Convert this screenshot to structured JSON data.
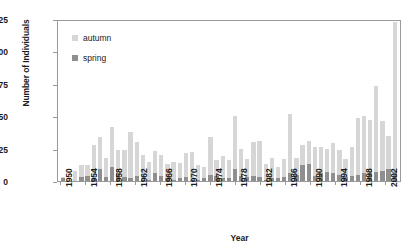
{
  "chart_data": {
    "type": "bar",
    "stacked": true,
    "title": "",
    "xlabel": "Year",
    "ylabel": "Number of Individuals",
    "ylim": [
      0,
      125
    ],
    "yticks": [
      0,
      25,
      50,
      75,
      100,
      125
    ],
    "grid": false,
    "legend_position": "top-left",
    "legend": [
      "autumn",
      "spring"
    ],
    "colors": {
      "autumn": "#d6d6d6",
      "spring": "#8f8f8f",
      "frame": "#9a9a9a"
    },
    "categories": [
      "1950",
      "1951",
      "1952",
      "1953",
      "1954",
      "1955",
      "1956",
      "1957",
      "1958",
      "1959",
      "1960",
      "1961",
      "1962",
      "1963",
      "1964",
      "1965",
      "1966",
      "1967",
      "1968",
      "1969",
      "1970",
      "1971",
      "1972",
      "1973",
      "1974",
      "1975",
      "1976",
      "1977",
      "1978",
      "1979",
      "1980",
      "1981",
      "1982",
      "1983",
      "1984",
      "1985",
      "1986",
      "1987",
      "1988",
      "1989",
      "1990",
      "1991",
      "1992",
      "1993",
      "1994",
      "1995",
      "1996",
      "1997",
      "1998",
      "1999",
      "2000",
      "2001",
      "2002",
      "2003",
      "2004"
    ],
    "xtick_labels": [
      "1950",
      "1954",
      "1958",
      "1962",
      "1966",
      "1970",
      "1974",
      "1978",
      "1982",
      "1986",
      "1990",
      "1994",
      "1998",
      "2002"
    ],
    "xtick_indices": [
      0,
      4,
      8,
      12,
      16,
      20,
      24,
      28,
      32,
      36,
      40,
      44,
      48,
      52
    ],
    "series": [
      {
        "name": "spring",
        "color": "#8f8f8f",
        "values": [
          2,
          0,
          0,
          3,
          4,
          2,
          9,
          3,
          11,
          6,
          3,
          2,
          4,
          1,
          1,
          6,
          4,
          2,
          1,
          2,
          3,
          1,
          1,
          2,
          5,
          4,
          2,
          2,
          9,
          4,
          3,
          4,
          3,
          1,
          2,
          2,
          3,
          6,
          5,
          12,
          13,
          4,
          6,
          7,
          6,
          5,
          3,
          4,
          5,
          6,
          6,
          7,
          8,
          9,
          7
        ]
      },
      {
        "name": "autumn",
        "color": "#d6d6d6",
        "values": [
          1,
          0,
          8,
          9,
          8,
          26,
          25,
          15,
          31,
          18,
          21,
          36,
          26,
          19,
          14,
          17,
          16,
          11,
          14,
          12,
          19,
          21,
          11,
          9,
          29,
          12,
          17,
          14,
          41,
          21,
          14,
          26,
          28,
          12,
          16,
          9,
          14,
          46,
          13,
          16,
          18,
          22,
          20,
          18,
          23,
          19,
          14,
          22,
          44,
          44,
          41,
          66,
          38,
          26,
          116
        ]
      }
    ],
    "totals": [
      3,
      0,
      8,
      12,
      12,
      28,
      34,
      18,
      42,
      24,
      24,
      38,
      30,
      20,
      15,
      23,
      20,
      13,
      15,
      14,
      22,
      22,
      12,
      11,
      34,
      16,
      19,
      16,
      50,
      25,
      17,
      30,
      31,
      13,
      18,
      11,
      17,
      52,
      18,
      28,
      31,
      26,
      26,
      25,
      29,
      24,
      17,
      26,
      49,
      50,
      47,
      73,
      46,
      35,
      123
    ]
  }
}
